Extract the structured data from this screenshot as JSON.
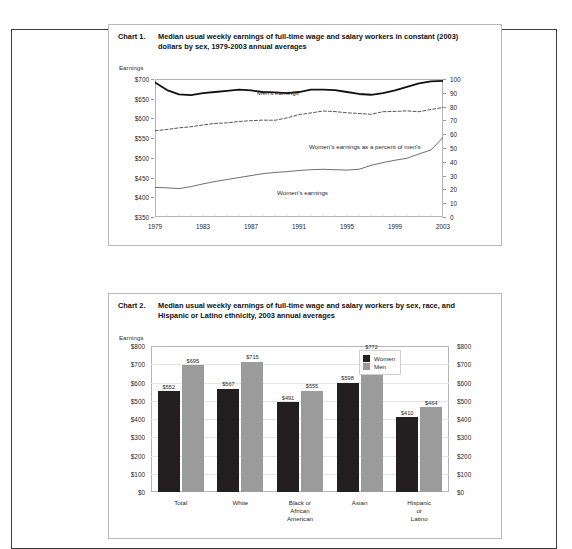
{
  "page": {
    "background": "#ffffff",
    "border_color": "#3b3b3b"
  },
  "charts": [
    {
      "number_label": "Chart 1.",
      "title": "Median usual weekly earnings of full-time wage and salary workers in constant (2003) dollars by sex, 1979-2003 annual averages",
      "earnings_caption": "Earnings",
      "series_labels": {
        "mens": "Men's earnings",
        "percent": "Women's earnings as a percent of men's",
        "womens": "Women's earnings"
      },
      "left_ticks": [
        "$700",
        "$650",
        "$600",
        "$550",
        "$500",
        "$450",
        "$400",
        "$350"
      ],
      "right_ticks": [
        "100",
        "90",
        "80",
        "70",
        "60",
        "50",
        "40",
        "30",
        "20",
        "10",
        "0"
      ],
      "x_ticks": [
        "1979",
        "1983",
        "1987",
        "1991",
        "1995",
        "1999",
        "2003"
      ]
    },
    {
      "number_label": "Chart 2.",
      "title": "Median usual weekly earnings of full-time wage and salary workers by sex, race, and Hispanic or Latino ethnicity, 2003 annual averages",
      "earnings_caption": "Earnings",
      "left_ticks": [
        "$800",
        "$700",
        "$600",
        "$500",
        "$400",
        "$300",
        "$200",
        "$100",
        "$0"
      ],
      "right_ticks": [
        "$800",
        "$700",
        "$600",
        "$500",
        "$400",
        "$300",
        "$200",
        "$100",
        "$0"
      ],
      "legend": [
        {
          "label": "Women",
          "color": "#231f20"
        },
        {
          "label": "Men",
          "color": "#9b9b9b"
        }
      ]
    }
  ],
  "chart_data": [
    {
      "type": "line",
      "title": "Median usual weekly earnings of full-time wage and salary workers in constant (2003) dollars by sex, 1979-2003 annual averages",
      "xlabel": "",
      "ylabel": "Earnings",
      "y2label": "",
      "ylim": [
        350,
        700
      ],
      "y2lim": [
        0,
        100
      ],
      "grid": true,
      "legend_position": "inline-annotations",
      "x": [
        1979,
        1980,
        1981,
        1982,
        1983,
        1984,
        1985,
        1986,
        1987,
        1988,
        1989,
        1990,
        1991,
        1992,
        1993,
        1994,
        1995,
        1996,
        1997,
        1998,
        1999,
        2000,
        2001,
        2002,
        2003
      ],
      "series": [
        {
          "name": "Men's earnings",
          "axis": "left",
          "style": "solid-thick",
          "values": [
            691,
            672,
            661,
            659,
            664,
            667,
            670,
            673,
            671,
            667,
            666,
            664,
            667,
            673,
            673,
            672,
            667,
            662,
            660,
            664,
            671,
            680,
            689,
            694,
            695
          ]
        },
        {
          "name": "Women's earnings",
          "axis": "left",
          "style": "solid-thin",
          "values": [
            425,
            424,
            422,
            427,
            434,
            440,
            445,
            450,
            455,
            460,
            463,
            465,
            468,
            470,
            471,
            470,
            469,
            471,
            481,
            488,
            494,
            499,
            510,
            520,
            552
          ]
        },
        {
          "name": "Women's earnings as a percent of men's",
          "axis": "right",
          "style": "dashed",
          "values": [
            62.5,
            63.4,
            64.6,
            65.4,
            66.7,
            67.8,
            68.2,
            69.2,
            69.8,
            70.2,
            70.1,
            71.8,
            74.2,
            75.4,
            76.8,
            76.4,
            75.5,
            75.0,
            74.4,
            76.3,
            76.5,
            76.9,
            76.3,
            77.9,
            79.4
          ]
        }
      ]
    },
    {
      "type": "bar",
      "title": "Median usual weekly earnings of full-time wage and salary workers by sex, race, and Hispanic or Latino ethnicity, 2003 annual averages",
      "xlabel": "",
      "ylabel": "Earnings",
      "ylim": [
        0,
        800
      ],
      "grid": true,
      "legend_position": "upper-right",
      "categories": [
        "Total",
        "White",
        "Black or African American",
        "Asian",
        "Hispanic or Latino"
      ],
      "category_lines": [
        [
          "Total"
        ],
        [
          "White"
        ],
        [
          "Black or",
          "African",
          "American"
        ],
        [
          "Asian"
        ],
        [
          "Hispanic",
          "or",
          "Latino"
        ]
      ],
      "series": [
        {
          "name": "Women",
          "color": "#231f20",
          "values": [
            552,
            567,
            491,
            598,
            410
          ]
        },
        {
          "name": "Men",
          "color": "#9b9b9b",
          "values": [
            695,
            715,
            555,
            772,
            464
          ]
        }
      ],
      "data_labels": [
        [
          "$552",
          "$695"
        ],
        [
          "$567",
          "$715"
        ],
        [
          "$491",
          "$555"
        ],
        [
          "$598",
          "$772"
        ],
        [
          "$410",
          "$464"
        ]
      ]
    }
  ]
}
